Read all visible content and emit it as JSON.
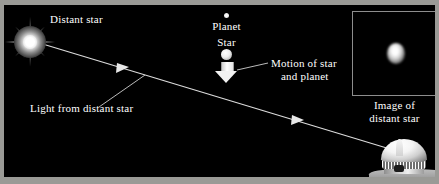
{
  "figure": {
    "background_color": "#000000",
    "frame_color": "#9a9a96",
    "label_color": "#ffffff",
    "line_color": "#d8d8d8"
  },
  "labels": {
    "distant_star": "Distant star",
    "light_from_distant_star": "Light from distant star",
    "planet": "Planet",
    "star": "Star",
    "motion_line1": "Motion of star",
    "motion_line2": "and planet",
    "inset_caption_line1": "Image of",
    "inset_caption_line2": "distant star"
  },
  "objects": {
    "distant_star": {
      "name": "distant-star",
      "x": 26,
      "y": 37,
      "kind": "starburst"
    },
    "planet": {
      "name": "planet",
      "x": 222,
      "y": 10,
      "diameter": 5
    },
    "star": {
      "name": "star",
      "x": 222,
      "y": 49,
      "diameter": 11
    },
    "motion_arrow": {
      "name": "motion-arrow",
      "direction": "down",
      "x": 222,
      "y": 67
    },
    "observatory": {
      "name": "observatory-dome",
      "x": 400,
      "y": 157
    },
    "inset_box": {
      "name": "inset-image-box",
      "x": 348,
      "y": 6,
      "width": 83,
      "height": 83
    },
    "inset_blob": {
      "name": "star-image-blob",
      "x": 391,
      "y": 47
    }
  },
  "light_ray": {
    "name": "light-ray",
    "from": [
      36,
      42
    ],
    "to": [
      388,
      148
    ],
    "arrowheads": [
      [
        120,
        67
      ],
      [
        297,
        120
      ]
    ]
  },
  "leader_lines": [
    {
      "name": "light-label-leader",
      "from": [
        97,
        107
      ],
      "to": [
        144,
        76
      ]
    },
    {
      "name": "motion-label-leader",
      "from": [
        268,
        62
      ],
      "to": [
        236,
        69
      ]
    }
  ]
}
